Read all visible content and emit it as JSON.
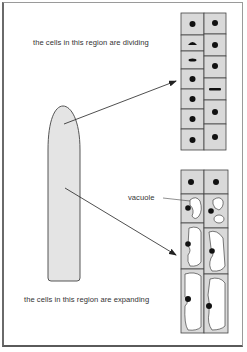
{
  "labels": {
    "dividing": "the cells in this region are dividing",
    "vacuole": "vacuole",
    "expanding": "the cells in this region are expanding"
  },
  "colors": {
    "cell_fill": "#d9d9d9",
    "root_fill": "#e4e4e4",
    "outline": "#444444",
    "nucleus": "#111111",
    "vacuole_fill": "#ffffff"
  },
  "diagram": {
    "regions": [
      {
        "name": "dividing region",
        "columns": 2,
        "cells_left": 7,
        "cells_right": 6
      },
      {
        "name": "expanding region",
        "columns": 2,
        "cells_left": 3,
        "cells_right": 3
      }
    ]
  }
}
